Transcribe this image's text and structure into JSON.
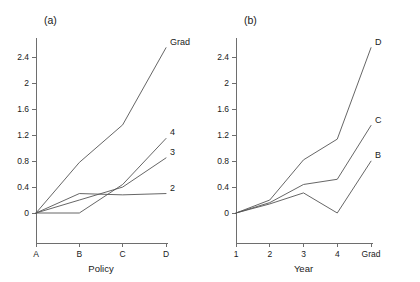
{
  "figure": {
    "background_color": "#ffffff",
    "line_color": "#555555",
    "axis_color": "#6e6e6e",
    "text_color": "#1a1a1a"
  },
  "chart_data": [
    {
      "type": "line",
      "panel_tag": "(a)",
      "title": "",
      "xlabel": "Policy",
      "ylabel": "",
      "categories": [
        "A",
        "B",
        "C",
        "D"
      ],
      "xticklabels": [
        "A",
        "B",
        "C",
        "D"
      ],
      "yticklabels": [
        "0",
        "0.4",
        "0.8",
        "1.2",
        "1.6",
        "2",
        "2.4"
      ],
      "ytickvalues": [
        0,
        0.4,
        0.8,
        1.2,
        1.6,
        2,
        2.4
      ],
      "ylim": [
        0,
        2.7
      ],
      "grid": false,
      "legend_position": "right-end-labels",
      "series": [
        {
          "name": "Grad",
          "label": "Grad",
          "values": [
            0,
            0.78,
            1.36,
            2.55
          ]
        },
        {
          "name": "4",
          "label": "4",
          "values": [
            0,
            0,
            0.44,
            1.15
          ]
        },
        {
          "name": "3",
          "label": "3",
          "values": [
            0,
            0.2,
            0.4,
            0.85
          ]
        },
        {
          "name": "2",
          "label": "2",
          "values": [
            0,
            0.3,
            0.28,
            0.3
          ]
        }
      ]
    },
    {
      "type": "line",
      "panel_tag": "(b)",
      "title": "",
      "xlabel": "Year",
      "ylabel": "",
      "categories": [
        "1",
        "2",
        "3",
        "4",
        "Grad"
      ],
      "xticklabels": [
        "1",
        "2",
        "3",
        "4",
        "Grad"
      ],
      "yticklabels": [
        "0",
        "0.4",
        "0.8",
        "1.2",
        "1.6",
        "2",
        "2.4"
      ],
      "ytickvalues": [
        0,
        0.4,
        0.8,
        1.2,
        1.6,
        2,
        2.4
      ],
      "ylim": [
        0,
        2.7
      ],
      "grid": false,
      "legend_position": "right-end-labels",
      "series": [
        {
          "name": "D",
          "label": "D",
          "values": [
            0,
            0.2,
            0.82,
            1.14,
            2.55
          ]
        },
        {
          "name": "C",
          "label": "C",
          "values": [
            0,
            0.16,
            0.44,
            0.52,
            1.35
          ]
        },
        {
          "name": "B",
          "label": "B",
          "values": [
            0,
            0.14,
            0.31,
            0.0,
            0.8
          ]
        }
      ]
    }
  ]
}
